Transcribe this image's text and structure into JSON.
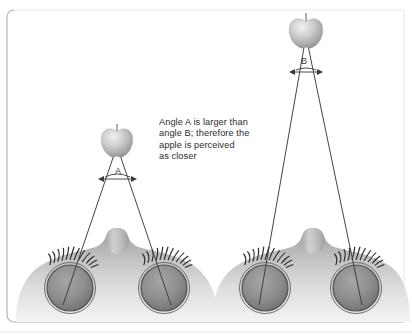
{
  "figure": {
    "caption": "Angle A is larger than\nangle B; therefore the\napple is perceived\nas closer",
    "caption_lines": [
      "Angle A is larger than",
      "angle B; therefore the",
      "apple is perceived",
      "as closer"
    ],
    "angle_labels": {
      "near": "A",
      "far": "B"
    },
    "colors": {
      "frame": "#b9b9b9",
      "line": "#3a3a3a",
      "text": "#2b2b2b",
      "apple_light": "#e4e4e4",
      "apple_mid": "#bcbcbc",
      "apple_dark": "#8f8f8f",
      "face_light": "#e8e8e8",
      "face_mid": "#c6c6c6",
      "face_dark": "#9a9a9a",
      "eye_fill": "#8e8e8e",
      "eye_ring": "#5a5a5a",
      "lash": "#2f2f2f",
      "background": "#ffffff"
    },
    "scenes": [
      {
        "name": "near-scene",
        "apple_label": "apple-near",
        "apple_x": 117,
        "apple_y": 138,
        "angle_label": "A",
        "angle_size": "larger",
        "eye_left_x": 70,
        "eye_right_x": 164,
        "eye_y": 288
      },
      {
        "name": "far-scene",
        "apple_label": "apple-far",
        "apple_x": 304,
        "apple_y": 27,
        "angle_label": "B",
        "angle_size": "smaller",
        "eye_left_x": 265,
        "eye_right_x": 356,
        "eye_y": 288
      }
    ]
  }
}
